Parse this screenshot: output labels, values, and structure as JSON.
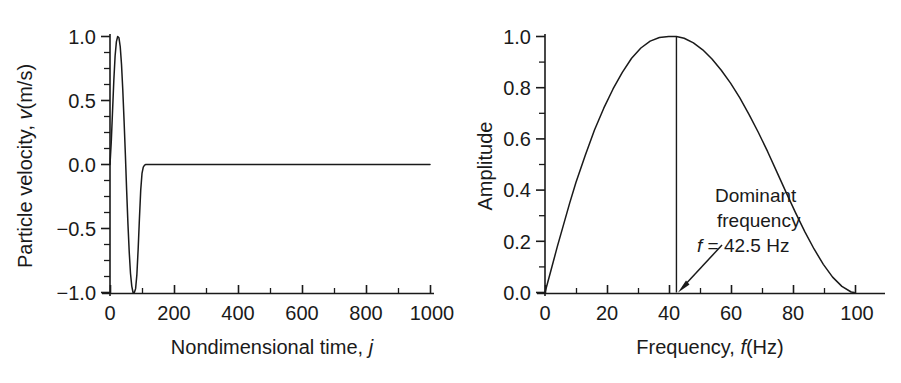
{
  "figure": {
    "background": "#ffffff",
    "ink_color": "#1a1a1a",
    "panel_count": 2
  },
  "chart_data": [
    {
      "id": "particle-velocity-waveform",
      "type": "line",
      "title": "",
      "xlabel": "Nondimensional time, j",
      "xlabel_plain": "Nondimensional time,",
      "xlabel_italic": "j",
      "ylabel": "Particle velocity, v(m/s)",
      "ylabel_plain_pre": "Particle velocity, ",
      "ylabel_italic": "v",
      "ylabel_plain_post": "(m/s)",
      "xlim": [
        0,
        1000
      ],
      "ylim": [
        -1.0,
        1.0
      ],
      "xticks": [
        0,
        200,
        400,
        600,
        800,
        1000
      ],
      "xticklabels": [
        "0",
        "200",
        "400",
        "600",
        "800",
        "1000"
      ],
      "xminor_step": 100,
      "yticks": [
        -1.0,
        -0.5,
        0.0,
        0.5,
        1.0
      ],
      "yticklabels": [
        "−1.0",
        "−0.5",
        "0.0",
        "0.5",
        "1.0"
      ],
      "yminor_step": 0.25,
      "grid": false,
      "legend": false,
      "series": [
        {
          "name": "Particle velocity pulse",
          "color": "#1a1a1a",
          "x": [
            0,
            4,
            8,
            12,
            16,
            20,
            24,
            28,
            32,
            36,
            40,
            44,
            48,
            52,
            56,
            60,
            64,
            68,
            72,
            76,
            80,
            84,
            88,
            92,
            96,
            100,
            104,
            108,
            112,
            140,
            200,
            300,
            400,
            500,
            600,
            700,
            800,
            900,
            1000
          ],
          "y": [
            0.0,
            0.18,
            0.42,
            0.66,
            0.85,
            0.96,
            1.0,
            0.99,
            0.92,
            0.78,
            0.58,
            0.34,
            0.08,
            -0.2,
            -0.46,
            -0.68,
            -0.85,
            -0.95,
            -1.0,
            -1.0,
            -0.97,
            -0.86,
            -0.66,
            -0.42,
            -0.2,
            -0.07,
            -0.02,
            -0.005,
            0.0,
            0.0,
            0.0,
            0.0,
            0.0,
            0.0,
            0.0,
            0.0,
            0.0,
            0.0,
            0.0
          ]
        }
      ],
      "annotations": []
    },
    {
      "id": "amplitude-spectrum",
      "type": "line",
      "title": "",
      "xlabel": "Frequency, f(Hz)",
      "xlabel_plain_pre": "Frequency, ",
      "xlabel_italic": "f",
      "xlabel_plain_post": "(Hz)",
      "ylabel": "Amplitude",
      "xlim": [
        0,
        108
      ],
      "ylim": [
        0.0,
        1.0
      ],
      "xticks": [
        0,
        20,
        40,
        60,
        80,
        100
      ],
      "xticklabels": [
        "0",
        "20",
        "40",
        "60",
        "80",
        "100"
      ],
      "xminor_step": 10,
      "yticks": [
        0.0,
        0.2,
        0.4,
        0.6,
        0.8,
        1.0
      ],
      "yticklabels": [
        "0.0",
        "0.2",
        "0.4",
        "0.6",
        "0.8",
        "1.0"
      ],
      "yminor_step": 0.1,
      "grid": false,
      "legend": false,
      "series": [
        {
          "name": "Amplitude spectrum",
          "color": "#1a1a1a",
          "x": [
            0,
            2,
            4,
            6,
            8,
            10,
            13,
            16,
            19,
            22,
            25,
            28,
            31,
            34,
            37,
            40,
            42.5,
            45,
            48,
            51,
            54,
            57,
            60,
            63,
            66,
            69,
            72,
            75,
            78,
            81,
            84,
            87,
            90,
            93,
            96,
            99,
            100
          ],
          "y": [
            0.0,
            0.09,
            0.18,
            0.265,
            0.35,
            0.43,
            0.535,
            0.635,
            0.72,
            0.795,
            0.86,
            0.915,
            0.955,
            0.982,
            0.996,
            1.0,
            1.0,
            0.993,
            0.975,
            0.948,
            0.912,
            0.868,
            0.818,
            0.76,
            0.695,
            0.625,
            0.55,
            0.47,
            0.39,
            0.312,
            0.238,
            0.17,
            0.11,
            0.06,
            0.024,
            0.002,
            0.0
          ]
        }
      ],
      "marker_line": {
        "name": "dominant-frequency-line",
        "x": 42.5,
        "y_from": 0.0,
        "y_to": 1.0,
        "color": "#1a1a1a"
      },
      "annotations": [
        {
          "name": "dominant-frequency-annotation",
          "line1": "Dominant",
          "line2": "frequency",
          "line3_italic": "f",
          "line3_rest": " = 42.5 Hz",
          "points_to_x": 42.5,
          "points_to_y": 0.0
        }
      ]
    }
  ]
}
